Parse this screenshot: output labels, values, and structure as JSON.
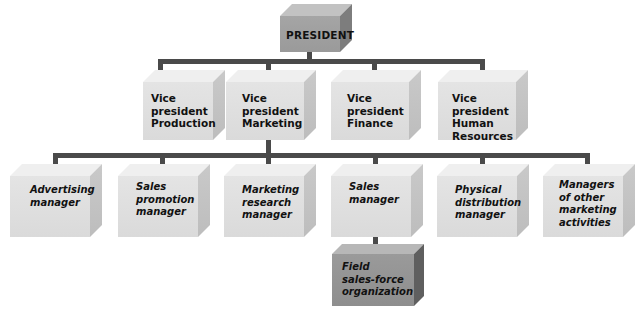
{
  "diagram": {
    "type": "organization-chart",
    "top": {
      "label": "PRESIDENT"
    },
    "vice_presidents": [
      {
        "label": "Vice\npresident\nProduction"
      },
      {
        "label": "Vice\npresident\nMarketing"
      },
      {
        "label": "Vice\npresident\nFinance"
      },
      {
        "label": "Vice\npresident\nHuman\nResources"
      }
    ],
    "marketing_managers": [
      {
        "label": "Advertising\nmanager"
      },
      {
        "label": "Sales\npromotion\nmanager"
      },
      {
        "label": "Marketing\nresearch\nmanager"
      },
      {
        "label": "Sales\nmanager"
      },
      {
        "label": "Physical\ndistribution\nmanager"
      },
      {
        "label": "Managers\nof other\nmarketing\nactivities"
      }
    ],
    "sales_subordinate": {
      "label": "Field\nsales-force\norganization"
    },
    "colors": {
      "connector": "#4a4a4a",
      "box_light": "#e0e0e0",
      "box_dark": "#9a9a9a"
    }
  }
}
